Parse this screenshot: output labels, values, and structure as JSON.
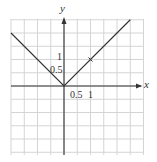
{
  "chart_data": {
    "type": "line",
    "title": "",
    "function": "y = |x|",
    "xlabel": "x",
    "ylabel": "y",
    "xlim": [
      -2,
      3
    ],
    "ylim": [
      -2.5,
      2.5
    ],
    "grid": true,
    "grid_step": 0.5,
    "tick_labels": {
      "x": [
        "0.5",
        "1"
      ],
      "y": [
        "0.5",
        "1"
      ]
    },
    "series": [
      {
        "name": "y = |x|",
        "x": [
          -2,
          0,
          2.5
        ],
        "y": [
          2,
          0,
          2.5
        ]
      }
    ],
    "annotations": [
      {
        "type": "tick-mark",
        "x": 1,
        "y": 1
      }
    ]
  },
  "labels": {
    "x_axis": "x",
    "y_axis": "y",
    "x_tick_half": "0.5",
    "x_tick_one": "1",
    "y_tick_half": "0.5",
    "y_tick_one": "1"
  },
  "colors": {
    "grid": "#d4d4d4",
    "axis": "#333333",
    "curve": "#333333"
  }
}
